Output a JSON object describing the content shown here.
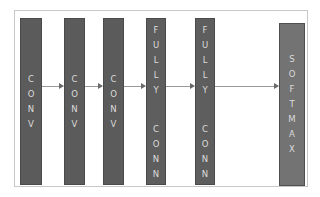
{
  "diagram": {
    "type": "cnn-architecture",
    "layers": [
      {
        "id": "conv1",
        "label": "CONV",
        "letters": [
          "C",
          "O",
          "N",
          "V"
        ]
      },
      {
        "id": "conv2",
        "label": "CONV",
        "letters": [
          "C",
          "O",
          "N",
          "V"
        ]
      },
      {
        "id": "conv3",
        "label": "CONV",
        "letters": [
          "C",
          "O",
          "N",
          "V"
        ]
      },
      {
        "id": "fc1",
        "label": "FULLY CONN",
        "letters": [
          "F",
          "U",
          "L",
          "L",
          "Y"
        ],
        "letters2": [
          "C",
          "O",
          "N",
          "N"
        ]
      },
      {
        "id": "fc2",
        "label": "FULLY CONN",
        "letters": [
          "F",
          "U",
          "L",
          "L",
          "Y"
        ],
        "letters2": [
          "C",
          "O",
          "N",
          "N"
        ]
      },
      {
        "id": "softmax",
        "label": "SOFTMAX",
        "letters": [
          "S",
          "O",
          "F",
          "T",
          "M",
          "A",
          "X"
        ]
      }
    ],
    "edges": [
      {
        "from": "conv1",
        "to": "conv2"
      },
      {
        "from": "conv2",
        "to": "conv3"
      },
      {
        "from": "conv3",
        "to": "fc1"
      },
      {
        "from": "fc1",
        "to": "fc2"
      },
      {
        "from": "fc2",
        "to": "softmax"
      }
    ],
    "colors": {
      "layer_fill": "#5b5b5b",
      "softmax_fill": "#737373",
      "text": "#dcdcdc",
      "arrow": "#9a9a9a",
      "frame": "#c8c8c8"
    }
  }
}
